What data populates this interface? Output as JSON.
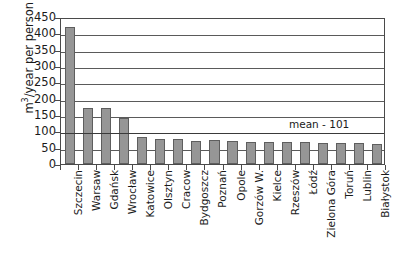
{
  "chart_data": {
    "type": "bar",
    "title": "",
    "subtitle": "",
    "xlabel": "",
    "ylabel": "m3/year per person",
    "ylabel_html": "m3/year per person",
    "ylim": [
      0,
      450
    ],
    "ytick_step": 50,
    "yticks": [
      450,
      400,
      350,
      300,
      250,
      200,
      150,
      100,
      50,
      0
    ],
    "grid": true,
    "grid_axis": "y",
    "legend": false,
    "legend_position": "none",
    "categories": [
      "Szczecin",
      "Warsaw",
      "Gdańsk",
      "Wrocław",
      "Katowice",
      "Olsztyn",
      "Cracow",
      "Bydgoszcz",
      "Poznań",
      "Opole",
      "Gorzów W.",
      "Kielce",
      "Rzeszów",
      "Łódź",
      "Zielona Góra",
      "Toruń",
      "Lublin",
      "Białystok"
    ],
    "values": [
      420,
      173,
      173,
      140,
      84,
      78,
      77,
      71,
      75,
      70,
      67,
      66,
      67,
      68,
      65,
      65,
      64,
      62
    ],
    "bar_color": "#969696",
    "bar_edge_color": "#5e5e5e",
    "annotations": [
      {
        "name": "mean-line",
        "label": "mean - 101",
        "value": 101,
        "type": "hline"
      }
    ]
  },
  "axis": {
    "y_title": "m",
    "y_title_sup": "3",
    "y_title_rest": "/year per person"
  },
  "colors": {
    "axis": "#4a4a4a",
    "grid": "#5a5a5a",
    "text": "#1a1a1a",
    "background": "#ffffff"
  }
}
